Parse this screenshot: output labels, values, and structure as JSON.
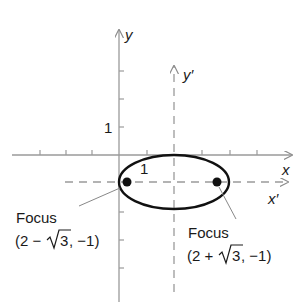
{
  "figure": {
    "type": "ellipse-with-translated-axes",
    "axes": {
      "x_label": "x",
      "y_label": "y",
      "x_prime_label": "x′",
      "y_prime_label": "y′",
      "unit_label_y": "1",
      "unit_label_inside": "1"
    },
    "ellipse": {
      "center": [
        2,
        -1
      ],
      "semi_major": 2,
      "semi_minor": 1
    },
    "foci": [
      {
        "name": "left-focus",
        "title": "Focus",
        "coords": "(2 − √3, −1)",
        "coord_prefix": "(2 −",
        "coord_root": "3",
        "coord_suffix": ", −1)"
      },
      {
        "name": "right-focus",
        "title": "Focus",
        "coords": "(2 + √3, −1)",
        "coord_prefix": "(2 +",
        "coord_root": "3",
        "coord_suffix": ", −1)"
      }
    ],
    "colors": {
      "axis": "#9a9a9a",
      "ellipse": "#111111",
      "text": "#1a1a1a"
    }
  }
}
